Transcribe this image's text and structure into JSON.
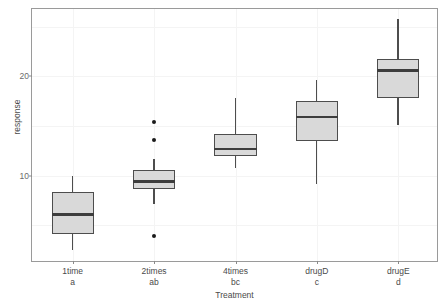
{
  "chart_data": {
    "type": "box",
    "title": "",
    "xlabel": "Treatment",
    "ylabel": "response",
    "ylim": [
      1.2,
      26.8
    ],
    "yticks": [
      10,
      20
    ],
    "ytick_labels": [
      "10",
      "20"
    ],
    "grid": true,
    "legend": "none",
    "categories": [
      "1time",
      "2times",
      "4times",
      "drugD",
      "drugE"
    ],
    "group_letters": [
      "a",
      "ab",
      "bc",
      "c",
      "d"
    ],
    "boxes": [
      {
        "category": "1time",
        "letter": "a",
        "lower_whisker": 2.5,
        "q1": 4.1,
        "median": 6.1,
        "q3": 8.4,
        "upper_whisker": 10.0,
        "outliers": []
      },
      {
        "category": "2times",
        "letter": "ab",
        "lower_whisker": 7.1,
        "q1": 8.7,
        "median": 9.4,
        "q3": 10.6,
        "upper_whisker": 11.7,
        "outliers": [
          15.4,
          13.6,
          3.9
        ]
      },
      {
        "category": "4times",
        "letter": "bc",
        "lower_whisker": 10.8,
        "q1": 12.0,
        "median": 12.7,
        "q3": 14.2,
        "upper_whisker": 17.8,
        "outliers": []
      },
      {
        "category": "drugD",
        "letter": "c",
        "lower_whisker": 9.2,
        "q1": 13.5,
        "median": 15.9,
        "q3": 17.5,
        "upper_whisker": 19.6,
        "outliers": []
      },
      {
        "category": "drugE",
        "letter": "d",
        "lower_whisker": 15.1,
        "q1": 17.8,
        "median": 20.6,
        "q3": 21.8,
        "upper_whisker": 25.8,
        "outliers": []
      }
    ]
  },
  "style": {
    "box_fill": "#d9d9d9",
    "box_border": "#4d4d4d",
    "median_color": "#3d3d3d",
    "outlier_color": "#1a1a1a",
    "panel_border": "#9a9a9a",
    "grid_color": "#f4f4f4",
    "text_color": "#4a4a4a"
  }
}
